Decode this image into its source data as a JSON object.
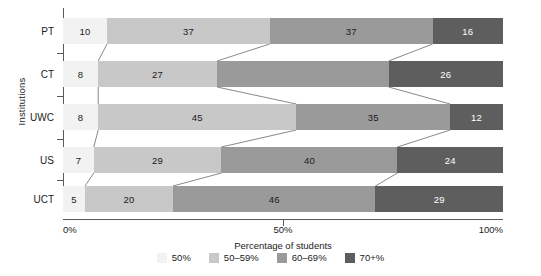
{
  "chart_data": {
    "type": "bar",
    "orientation": "horizontal",
    "stacked": true,
    "normalized": true,
    "title": "",
    "xlabel": "Percentage of students",
    "ylabel": "Institutions",
    "categories": [
      "PT",
      "CT",
      "UWC",
      "US",
      "UCT"
    ],
    "xlim": [
      0,
      100
    ],
    "xticks": [
      0,
      50,
      100
    ],
    "xticklabels": [
      "0%",
      "50%",
      "100%"
    ],
    "grid": false,
    "legend_position": "bottom",
    "series": [
      {
        "name": "50%",
        "color": "#f2f2f2",
        "values": [
          10,
          8,
          8,
          7,
          5
        ],
        "labels": [
          "10",
          "8",
          "8",
          "7",
          "5"
        ]
      },
      {
        "name": "50–59%",
        "color": "#c8c8c8",
        "values": [
          37,
          27,
          45,
          29,
          20
        ],
        "labels": [
          "37",
          "27",
          "45",
          "29",
          "20"
        ]
      },
      {
        "name": "60–69%",
        "color": "#9a9a9a",
        "values": [
          37,
          39,
          35,
          40,
          46
        ],
        "labels": [
          "37",
          "",
          "35",
          "40",
          "46"
        ]
      },
      {
        "name": "70+%",
        "color": "#5e5e5e",
        "values": [
          16,
          26,
          12,
          24,
          29
        ],
        "labels": [
          "16",
          "26",
          "12",
          "24",
          "29"
        ]
      }
    ]
  },
  "axis": {
    "ylabel": "Institutions",
    "xlabel": "Percentage of students",
    "xticklabels": [
      "0%",
      "50%",
      "100%"
    ]
  },
  "legend": {
    "items": [
      {
        "label": "50%",
        "color": "#f2f2f2"
      },
      {
        "label": "50–59%",
        "color": "#c8c8c8"
      },
      {
        "label": "60–69%",
        "color": "#9a9a9a"
      },
      {
        "label": "70+%",
        "color": "#5e5e5e"
      }
    ]
  }
}
